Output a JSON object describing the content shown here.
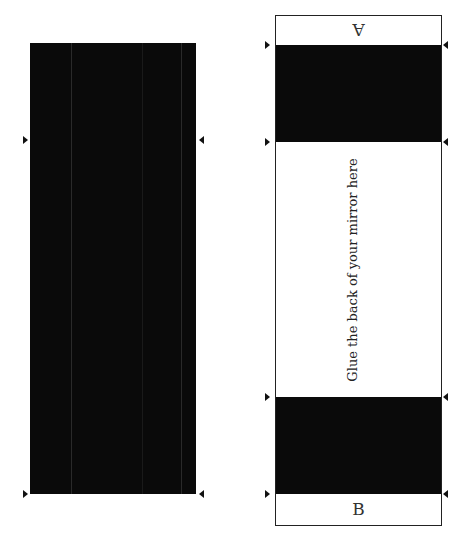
{
  "left_panel": {
    "description": "black mirror panel",
    "color": "#0a0a0a",
    "markers_y": [
      140,
      494
    ]
  },
  "right_template": {
    "top_label": "A",
    "bottom_label": "B",
    "center_text": "Glue the back of your mirror here",
    "band_color": "#0a0a0a",
    "markers_y": [
      45,
      142,
      397,
      494
    ]
  }
}
